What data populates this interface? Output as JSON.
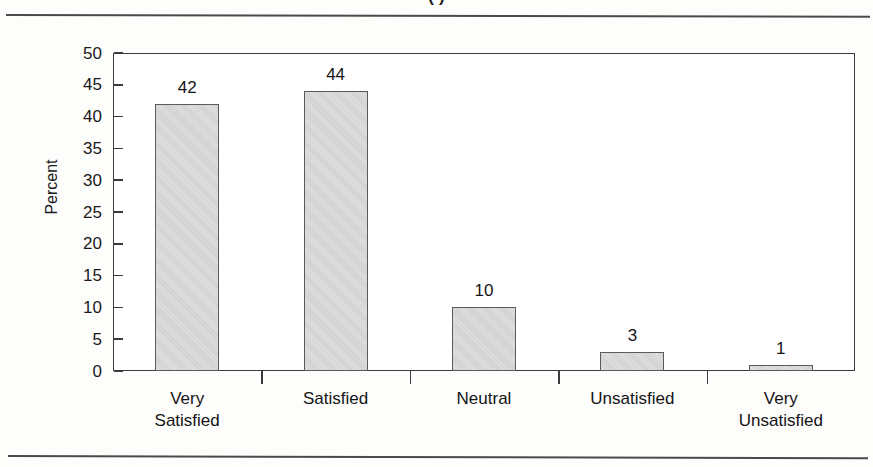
{
  "document": {
    "title_partial": "(  )",
    "rule_color": "#4a4a4a"
  },
  "chart_data": {
    "type": "bar",
    "title": "",
    "xlabel": "",
    "ylabel": "Percent",
    "categories": [
      "Very\nSatisfied",
      "Satisfied",
      "Neutral",
      "Unsatisfied",
      "Very\nUnsatisfied"
    ],
    "values": [
      42,
      44,
      10,
      3,
      1
    ],
    "value_labels": [
      "42",
      "44",
      "10",
      "3",
      "1"
    ],
    "ylim": [
      0,
      50
    ],
    "ytick_labels": [
      "50",
      "45",
      "40",
      "35",
      "30",
      "25",
      "20",
      "15",
      "10",
      "5",
      "0"
    ],
    "ytick_values": [
      50,
      45,
      40,
      35,
      30,
      25,
      20,
      15,
      10,
      5,
      0
    ],
    "grid": false,
    "legend": false,
    "legend_position": "none",
    "bar_fill": "#d2d2d2",
    "bar_border": "#5a5a5a",
    "axis_color": "#3b3b3b",
    "text_color": "#141414"
  }
}
